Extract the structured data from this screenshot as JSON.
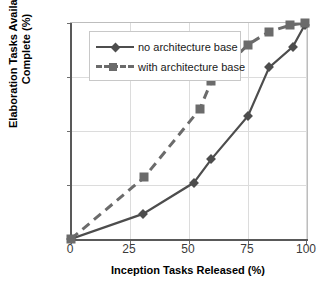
{
  "chart_data": {
    "type": "line",
    "title": "",
    "xlabel": "Inception Tasks Released (%)",
    "ylabel_line1": "Elaboration Tasks Available to",
    "ylabel_line2": "Complete (%)",
    "xlim": [
      0,
      100
    ],
    "ylim": [
      0,
      100
    ],
    "xticks": [
      0,
      25,
      50,
      75,
      100
    ],
    "yticks": [
      0,
      25,
      50,
      75,
      100
    ],
    "xtick_labels": [
      "0",
      "25",
      "50",
      "75",
      "100"
    ],
    "ytick_labels": [
      "0",
      "25",
      "50",
      "75",
      "100"
    ],
    "grid": true,
    "legend_position": "upper-left-inside",
    "series": [
      {
        "name": "no architecture base",
        "marker": "diamond",
        "linestyle": "solid",
        "color": "#4d4d4d",
        "points": [
          {
            "x": 0,
            "y": 0
          },
          {
            "x": 30.5,
            "y": 11.6
          },
          {
            "x": 52,
            "y": 26
          },
          {
            "x": 59.5,
            "y": 37
          },
          {
            "x": 75,
            "y": 57
          },
          {
            "x": 84,
            "y": 79.5
          },
          {
            "x": 94,
            "y": 89
          },
          {
            "x": 99,
            "y": 99
          }
        ]
      },
      {
        "name": "with architecture base",
        "marker": "square",
        "linestyle": "dashed",
        "color": "#6b6b6b",
        "points": [
          {
            "x": 0,
            "y": 0
          },
          {
            "x": 31,
            "y": 28.5
          },
          {
            "x": 54.5,
            "y": 60
          },
          {
            "x": 59.5,
            "y": 73
          },
          {
            "x": 75,
            "y": 90
          },
          {
            "x": 84,
            "y": 96
          },
          {
            "x": 93,
            "y": 99
          },
          {
            "x": 99,
            "y": 100
          }
        ]
      }
    ]
  },
  "legend": {
    "items": [
      {
        "label": "no architecture base"
      },
      {
        "label": "with architecture base"
      }
    ]
  },
  "axes": {
    "x_title": "Inception Tasks Released (%)",
    "y_title_line1": "Elaboration Tasks Available to",
    "y_title_line2": "Complete (%)"
  }
}
